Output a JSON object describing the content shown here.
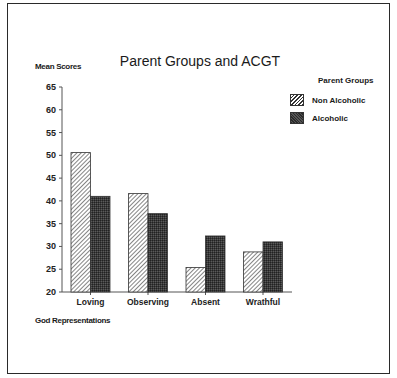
{
  "chart_data": {
    "type": "bar",
    "title": "Parent Groups and ACGT",
    "xlabel": "God Representations",
    "ylabel": "Mean Scores",
    "categories": [
      "Loving",
      "Observing",
      "Absent",
      "Wrathful"
    ],
    "series": [
      {
        "name": "Non Alcoholic",
        "pattern": "diagonal-hatch",
        "values": [
          50.6,
          41.6,
          25.4,
          28.8
        ]
      },
      {
        "name": "Alcoholic",
        "pattern": "dark-stipple",
        "values": [
          41.0,
          37.2,
          32.3,
          31.0
        ]
      }
    ],
    "ylim": [
      20,
      65
    ],
    "yticks": [
      20,
      25,
      30,
      35,
      40,
      45,
      50,
      55,
      60,
      65
    ],
    "legend_title": "Parent Groups",
    "legend_position": "upper right",
    "grid": false
  },
  "labels": {
    "title": "Parent Groups and ACGT",
    "ylabel": "Mean Scores",
    "xlabel": "God Representations",
    "legend_title": "Parent Groups",
    "legend_items": [
      "Non Alcoholic",
      "Alcoholic"
    ]
  }
}
